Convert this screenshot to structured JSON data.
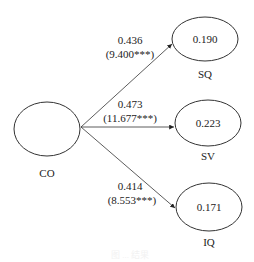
{
  "diagram": {
    "source": {
      "id": "CO",
      "label": "CO"
    },
    "targets": [
      {
        "id": "SQ",
        "label": "SQ",
        "r2": "0.190",
        "coef": "0.436",
        "t": "(9.400***)"
      },
      {
        "id": "SV",
        "label": "SV",
        "r2": "0.223",
        "coef": "0.473",
        "t": "(11.677***)"
      },
      {
        "id": "IQ",
        "label": "IQ",
        "r2": "0.171",
        "coef": "0.414",
        "t": "(8.553***)"
      }
    ],
    "caption": "图 ... 结果"
  }
}
